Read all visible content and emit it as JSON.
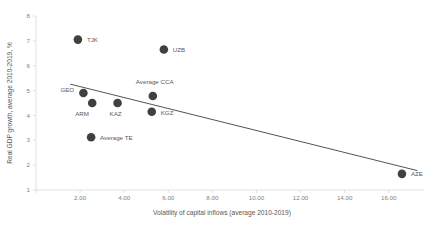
{
  "chart_data": {
    "type": "scatter",
    "title": "",
    "xlabel": "Volatility of capital inflows (average 2010-2019)",
    "ylabel": "Real GDP growth, average 2010-2019, %",
    "xlim": [
      0,
      17.6
    ],
    "ylim": [
      1,
      8
    ],
    "xticks": [
      "2.00",
      "4.00",
      "6.00",
      "8.00",
      "10.00",
      "12.00",
      "14.00",
      "16.00"
    ],
    "xtick_values": [
      2,
      4,
      6,
      8,
      10,
      12,
      14,
      16
    ],
    "yticks": [
      "1",
      "2",
      "3",
      "4",
      "5",
      "6",
      "7",
      "8"
    ],
    "ytick_values": [
      1,
      2,
      3,
      4,
      5,
      6,
      7,
      8
    ],
    "grid": false,
    "legend": "none",
    "marker_color": "#404040",
    "trendline_color": "#404040",
    "points": [
      {
        "label": "TJK",
        "x": 1.9,
        "y": 7.05,
        "label_dx": 9,
        "label_dy": 2.2
      },
      {
        "label": "UZB",
        "x": 5.8,
        "y": 6.65,
        "label_dx": 9,
        "label_dy": 2.2
      },
      {
        "label": "GEO",
        "x": 2.15,
        "y": 4.9,
        "label_dx": -23,
        "label_dy": -1.5
      },
      {
        "label": "ARM",
        "x": 2.55,
        "y": 4.5,
        "label_dx": -17,
        "label_dy": 13
      },
      {
        "label": "KAZ",
        "x": 3.7,
        "y": 4.5,
        "label_dx": -8,
        "label_dy": 13
      },
      {
        "label": "Average CCA",
        "x": 5.3,
        "y": 4.78,
        "label_dx": -17,
        "label_dy": -12
      },
      {
        "label": "KGZ",
        "x": 5.25,
        "y": 4.15,
        "label_dx": 9,
        "label_dy": 2.8
      },
      {
        "label": "Average TE",
        "x": 2.5,
        "y": 3.12,
        "label_dx": 9,
        "label_dy": 2.2
      },
      {
        "label": "AZE",
        "x": 16.6,
        "y": 1.65,
        "label_dx": 9,
        "label_dy": 2.2
      }
    ],
    "trendline": {
      "x0": 1.55,
      "y0": 5.26,
      "x1": 17.3,
      "y1": 1.78
    }
  }
}
